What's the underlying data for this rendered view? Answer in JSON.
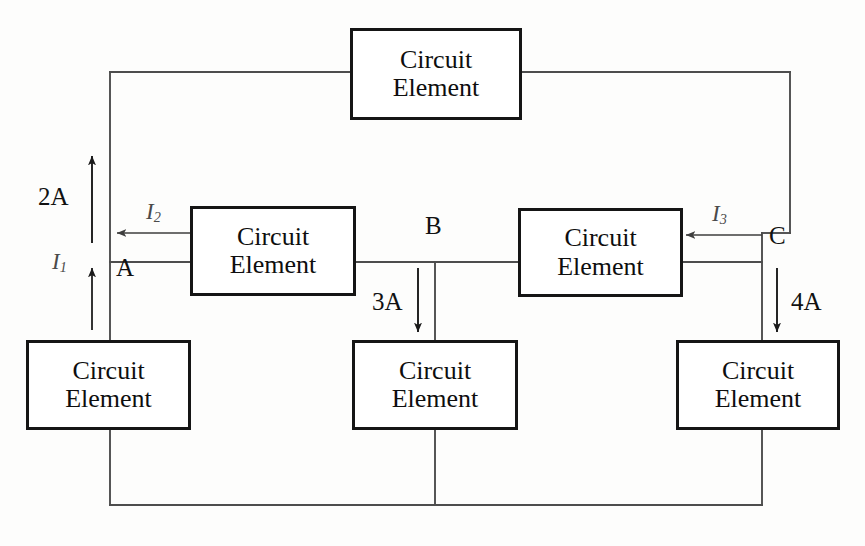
{
  "diagram": {
    "type": "circuit-diagram",
    "element_label_line1": "Circuit",
    "element_label_line2": "Element",
    "elements": [
      {
        "id": "top",
        "label_line1": "Circuit",
        "label_line2": "Element",
        "x": 350,
        "y": 28,
        "w": 172,
        "h": 92
      },
      {
        "id": "middle-left",
        "label_line1": "Circuit",
        "label_line2": "Element",
        "x": 190,
        "y": 206,
        "w": 166,
        "h": 90
      },
      {
        "id": "middle-right",
        "label_line1": "Circuit",
        "label_line2": "Element",
        "x": 518,
        "y": 208,
        "w": 165,
        "h": 89
      },
      {
        "id": "bottom-left",
        "label_line1": "Circuit",
        "label_line2": "Element",
        "x": 26,
        "y": 340,
        "w": 165,
        "h": 90
      },
      {
        "id": "bottom-middle",
        "label_line1": "Circuit",
        "label_line2": "Element",
        "x": 352,
        "y": 340,
        "w": 166,
        "h": 90
      },
      {
        "id": "bottom-right",
        "label_line1": "Circuit",
        "label_line2": "Element",
        "x": 676,
        "y": 340,
        "w": 164,
        "h": 90
      }
    ],
    "nodes": [
      {
        "id": "A",
        "label": "A",
        "x": 110,
        "y": 262
      },
      {
        "id": "B",
        "label": "B",
        "x": 435,
        "y": 262
      },
      {
        "id": "C",
        "label": "C",
        "x": 762,
        "y": 262
      }
    ],
    "currents": [
      {
        "id": "I1",
        "label": "I",
        "sub": "1",
        "value": "",
        "direction": "up",
        "style": "named"
      },
      {
        "id": "I2",
        "label": "I",
        "sub": "2",
        "value": "",
        "direction": "left",
        "style": "named"
      },
      {
        "id": "I3",
        "label": "I",
        "sub": "3",
        "value": "",
        "direction": "left",
        "style": "named"
      },
      {
        "id": "current-2A",
        "label": "2A",
        "value": "2A",
        "direction": "up",
        "style": "value"
      },
      {
        "id": "current-3A",
        "label": "3A",
        "value": "3A",
        "direction": "down",
        "style": "value"
      },
      {
        "id": "current-4A",
        "label": "4A",
        "value": "4A",
        "direction": "down",
        "style": "value"
      }
    ],
    "labels": {
      "node_a": "A",
      "node_b": "B",
      "node_c": "C",
      "current_2a": "2A",
      "current_3a": "3A",
      "current_4a": "4A",
      "current_i1_base": "I",
      "current_i1_sub": "1",
      "current_i2_base": "I",
      "current_i2_sub": "2",
      "current_i3_base": "I",
      "current_i3_sub": "3"
    },
    "colors": {
      "wire": "#4d4d4d",
      "box_border": "#151515",
      "text": "#111111",
      "current_label": "#4a4a4a",
      "background": "#fdfdfc"
    }
  }
}
